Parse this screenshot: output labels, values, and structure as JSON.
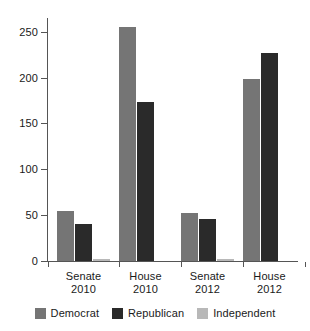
{
  "chart_data": {
    "type": "bar",
    "title": "",
    "xlabel": "",
    "ylabel": "",
    "categories": [
      "Senate\n2010",
      "House\n2010",
      "Senate\n2012",
      "House\n2012"
    ],
    "category_lines": [
      [
        "Senate",
        "2010"
      ],
      [
        "House",
        "2010"
      ],
      [
        "Senate",
        "2012"
      ],
      [
        "House",
        "2012"
      ]
    ],
    "series": [
      {
        "name": "Democrat",
        "color": "#757575",
        "values": [
          54,
          255,
          52,
          199
        ]
      },
      {
        "name": "Republican",
        "color": "#2a2a2a",
        "values": [
          40,
          173,
          46,
          227
        ]
      },
      {
        "name": "Independent",
        "color": "#b8b8b8",
        "values": [
          2,
          0,
          2,
          0
        ]
      }
    ],
    "ylim": [
      0,
      265
    ],
    "yticks": [
      0,
      50,
      100,
      150,
      200,
      250
    ],
    "ytick_labels": [
      "0",
      "50",
      "100",
      "150",
      "200",
      "250"
    ],
    "grid": false,
    "legend_position": "bottom"
  },
  "legend": {
    "entries": [
      {
        "label": "Democrat"
      },
      {
        "label": "Republican"
      },
      {
        "label": "Independent"
      }
    ]
  },
  "axis": {
    "y_labels": [
      "250",
      "200",
      "150",
      "100",
      "50",
      "0"
    ]
  }
}
